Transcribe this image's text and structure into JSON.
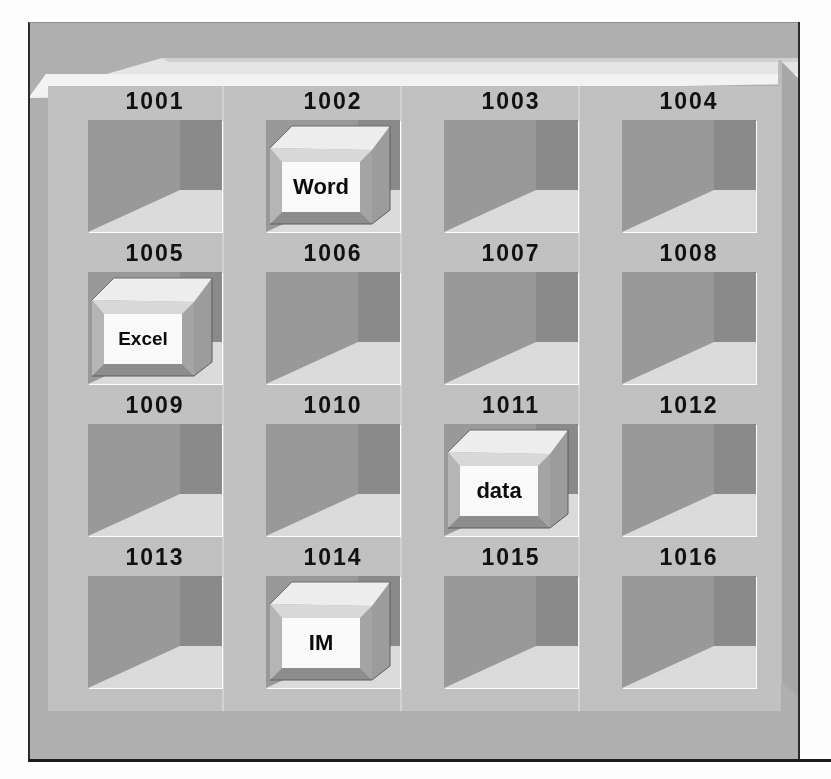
{
  "figure": {
    "kind": "memory-slot-illustration",
    "rows": 4,
    "columns": 4,
    "total_slots": 16
  },
  "colors": {
    "page_background": "#ffffff",
    "cabinet_frame": "#b0b0b0",
    "cabinet_outline": "#2b2b2b",
    "inner_panel": "#c2c2c2",
    "lid_highlight": "#e4e4e4",
    "lid_shade": "#cfcfcf",
    "slot_back_wall": "#9a9a9a",
    "slot_side_wall": "#8b8b8b",
    "slot_floor": "#dcdcdc",
    "box_top_face": "#e8e8e8",
    "box_right_face": "#9d9d9d",
    "box_front_bevel": "#c8c8c8",
    "box_label_face": "#fbfbfb",
    "label_text": "#111111"
  },
  "slots": [
    {
      "address": "1001",
      "occupied": false,
      "content": ""
    },
    {
      "address": "1002",
      "occupied": true,
      "content": "Word"
    },
    {
      "address": "1003",
      "occupied": false,
      "content": ""
    },
    {
      "address": "1004",
      "occupied": false,
      "content": ""
    },
    {
      "address": "1005",
      "occupied": true,
      "content": "Excel"
    },
    {
      "address": "1006",
      "occupied": false,
      "content": ""
    },
    {
      "address": "1007",
      "occupied": false,
      "content": ""
    },
    {
      "address": "1008",
      "occupied": false,
      "content": ""
    },
    {
      "address": "1009",
      "occupied": false,
      "content": ""
    },
    {
      "address": "1010",
      "occupied": false,
      "content": ""
    },
    {
      "address": "1011",
      "occupied": true,
      "content": "data"
    },
    {
      "address": "1012",
      "occupied": false,
      "content": ""
    },
    {
      "address": "1013",
      "occupied": false,
      "content": ""
    },
    {
      "address": "1014",
      "occupied": true,
      "content": "IM"
    },
    {
      "address": "1015",
      "occupied": false,
      "content": ""
    },
    {
      "address": "1016",
      "occupied": false,
      "content": ""
    }
  ]
}
